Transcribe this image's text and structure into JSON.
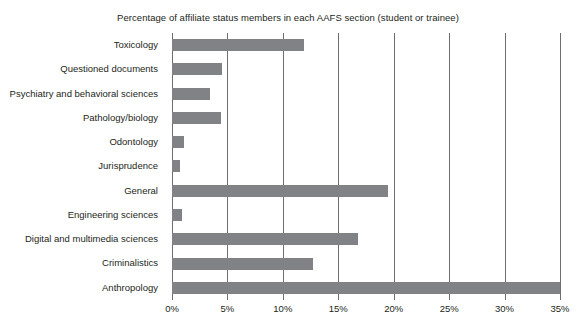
{
  "chart_data": {
    "type": "bar",
    "orientation": "horizontal",
    "title": "Percentage of affiliate status members in each AAFS section (student or trainee)",
    "xlabel": "",
    "ylabel": "",
    "categories": [
      "Toxicology",
      "Questioned documents",
      "Psychiatry and behavioral sciences",
      "Pathology/biology",
      "Odontology",
      "Jurisprudence",
      "General",
      "Engineering sciences",
      "Digital and multimedia sciences",
      "Criminalistics",
      "Anthropology"
    ],
    "values": [
      11.9,
      4.5,
      3.4,
      4.4,
      1.1,
      0.7,
      19.5,
      0.9,
      16.8,
      12.7,
      35.0
    ],
    "xlim": [
      0,
      35
    ],
    "xticks": [
      0,
      5,
      10,
      15,
      20,
      25,
      30,
      35
    ],
    "xtick_labels": [
      "0%",
      "5%",
      "10%",
      "15%",
      "20%",
      "25%",
      "30%",
      "35%"
    ],
    "grid": true,
    "legend": false,
    "bar_color": "#808285",
    "gridline_color": "#6d6e71",
    "text_color": "#231f20",
    "background_color": "#ffffff"
  }
}
